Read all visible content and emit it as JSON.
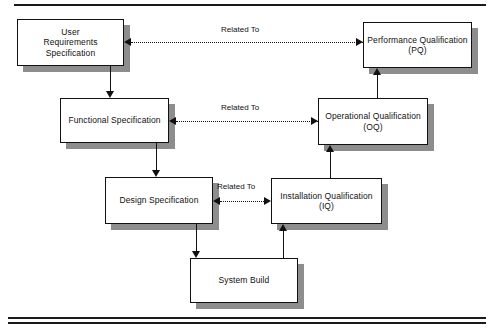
{
  "diagram": {
    "type": "v-model-validation-diagram",
    "nodes": [
      {
        "id": "urs",
        "label": "User\nRequirements\nSpecification"
      },
      {
        "id": "fs",
        "label": "Functional Specification"
      },
      {
        "id": "ds",
        "label": "Design Specification"
      },
      {
        "id": "sb",
        "label": "System Build"
      },
      {
        "id": "iq",
        "label": "Installation Qualification\n(IQ)"
      },
      {
        "id": "oq",
        "label": "Operational Qualification\n(OQ)"
      },
      {
        "id": "pq",
        "label": "Performance Qualification\n(PQ)"
      }
    ],
    "edge_labels": [
      {
        "id": "rel-pq",
        "text": "Related To"
      },
      {
        "id": "rel-oq",
        "text": "Related To"
      },
      {
        "id": "rel-iq",
        "text": "Related To"
      }
    ],
    "colors": {
      "line": "#111111",
      "shadow": "#8d8d8d",
      "box_fill": "#ffffff",
      "page": "#ffffff"
    }
  }
}
